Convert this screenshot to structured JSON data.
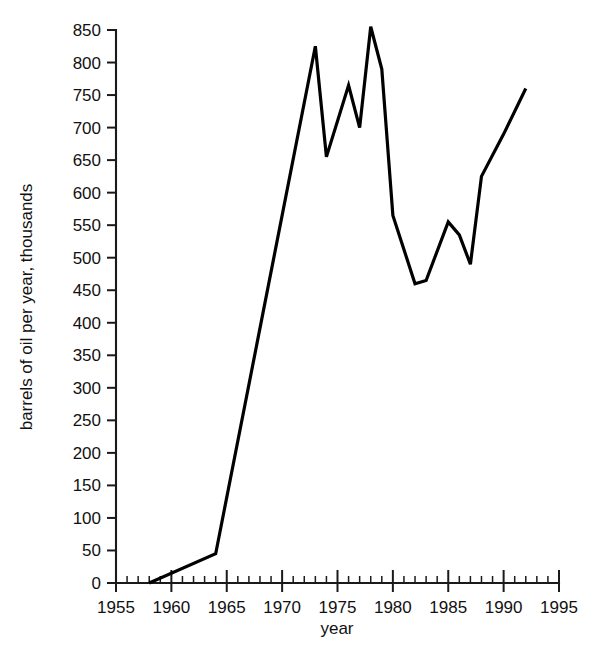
{
  "chart_data": {
    "type": "line",
    "title": "",
    "xlabel": "year",
    "ylabel": "barrels of oil per year, thousands",
    "xlim": [
      1955,
      1995
    ],
    "ylim": [
      0,
      850
    ],
    "grid": false,
    "legend": "none",
    "x_ticks": [
      1955,
      1960,
      1965,
      1970,
      1975,
      1980,
      1985,
      1990,
      1995
    ],
    "x_tick_labels": [
      "1955",
      "1960",
      "1965",
      "1970",
      "1975",
      "1980",
      "1985",
      "1990",
      "1995"
    ],
    "x_minor_tick_step": 1,
    "y_ticks": [
      0,
      50,
      100,
      150,
      200,
      250,
      300,
      350,
      400,
      450,
      500,
      550,
      600,
      650,
      700,
      750,
      800,
      850
    ],
    "y_tick_labels": [
      "0",
      "50",
      "100",
      "150",
      "200",
      "250",
      "300",
      "350",
      "400",
      "450",
      "500",
      "550",
      "600",
      "650",
      "700",
      "750",
      "800",
      "850"
    ],
    "series": [
      {
        "name": "barrels of oil per year",
        "color": "#000000",
        "x": [
          1958,
          1964,
          1973,
          1974,
          1976,
          1977,
          1978,
          1979,
          1980,
          1982,
          1983,
          1985,
          1986,
          1987,
          1988,
          1990,
          1992
        ],
        "values": [
          0,
          45,
          825,
          655,
          765,
          700,
          855,
          790,
          565,
          460,
          465,
          555,
          535,
          490,
          625,
          690,
          760
        ]
      }
    ]
  },
  "axes": {
    "x_axis_title": "year",
    "y_axis_title": "barrels of oil per year, thousands"
  }
}
